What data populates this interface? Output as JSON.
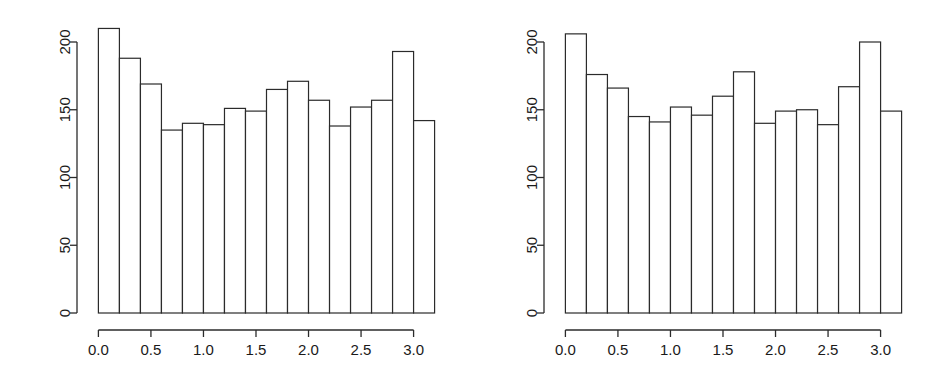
{
  "figure": {
    "background": "#ffffff",
    "line_color": "#2b2b2b",
    "panel_count": 2
  },
  "chart_data": [
    {
      "type": "bar",
      "name": "left-histogram",
      "title": "",
      "subtitle": "",
      "xlabel": "",
      "ylabel": "",
      "grid": false,
      "legend": false,
      "xlim": [
        -0.08,
        3.28
      ],
      "ylim": [
        0,
        215
      ],
      "xticks": [
        0.0,
        0.5,
        1.0,
        1.5,
        2.0,
        2.5,
        3.0
      ],
      "xtick_labels": [
        "0.0",
        "0.5",
        "1.0",
        "1.5",
        "2.0",
        "2.5",
        "3.0"
      ],
      "yticks": [
        0,
        50,
        100,
        150,
        200
      ],
      "ytick_labels": [
        "0",
        "50",
        "100",
        "150",
        "200"
      ],
      "bin_width": 0.2,
      "bin_edges": [
        0.0,
        0.2,
        0.4,
        0.6,
        0.8,
        1.0,
        1.2,
        1.4,
        1.6,
        1.8,
        2.0,
        2.2,
        2.4,
        2.6,
        2.8,
        3.0,
        3.2
      ],
      "categories": [
        "0.0-0.2",
        "0.2-0.4",
        "0.4-0.6",
        "0.6-0.8",
        "0.8-1.0",
        "1.0-1.2",
        "1.2-1.4",
        "1.4-1.6",
        "1.6-1.8",
        "1.8-2.0",
        "2.0-2.2",
        "2.2-2.4",
        "2.4-2.6",
        "2.6-2.8",
        "2.8-3.0",
        "3.0-3.2"
      ],
      "values": [
        210,
        188,
        169,
        135,
        140,
        139,
        151,
        149,
        165,
        171,
        157,
        138,
        152,
        157,
        193,
        142
      ]
    },
    {
      "type": "bar",
      "name": "right-histogram",
      "title": "",
      "subtitle": "",
      "xlabel": "",
      "ylabel": "",
      "grid": false,
      "legend": false,
      "xlim": [
        -0.08,
        3.28
      ],
      "ylim": [
        0,
        215
      ],
      "xticks": [
        0.0,
        0.5,
        1.0,
        1.5,
        2.0,
        2.5,
        3.0
      ],
      "xtick_labels": [
        "0.0",
        "0.5",
        "1.0",
        "1.5",
        "2.0",
        "2.5",
        "3.0"
      ],
      "yticks": [
        0,
        50,
        100,
        150,
        200
      ],
      "ytick_labels": [
        "0",
        "50",
        "100",
        "150",
        "200"
      ],
      "bin_width": 0.2,
      "bin_edges": [
        0.0,
        0.2,
        0.4,
        0.6,
        0.8,
        1.0,
        1.2,
        1.4,
        1.6,
        1.8,
        2.0,
        2.2,
        2.4,
        2.6,
        2.8,
        3.0,
        3.2
      ],
      "categories": [
        "0.0-0.2",
        "0.2-0.4",
        "0.4-0.6",
        "0.6-0.8",
        "0.8-1.0",
        "1.0-1.2",
        "1.2-1.4",
        "1.4-1.6",
        "1.6-1.8",
        "1.8-2.0",
        "2.0-2.2",
        "2.2-2.4",
        "2.4-2.6",
        "2.6-2.8",
        "2.8-3.0",
        "3.0-3.2"
      ],
      "values": [
        206,
        176,
        166,
        145,
        141,
        152,
        146,
        160,
        178,
        140,
        149,
        150,
        139,
        167,
        200,
        149
      ]
    }
  ]
}
